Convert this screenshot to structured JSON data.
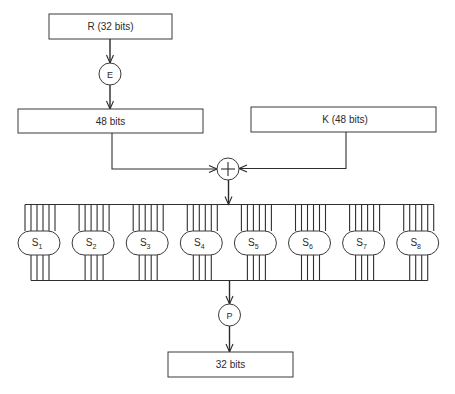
{
  "diagram": {
    "input_box": {
      "label": "R (32 bits)"
    },
    "expansion": {
      "label": "E"
    },
    "expanded_box": {
      "label": "48 bits"
    },
    "key_box": {
      "label": "K (48 bits)"
    },
    "xor": {
      "icon": "xor-circle-plus-icon"
    },
    "sboxes": [
      {
        "name": "S",
        "sub": "1"
      },
      {
        "name": "S",
        "sub": "2"
      },
      {
        "name": "S",
        "sub": "3"
      },
      {
        "name": "S",
        "sub": "4"
      },
      {
        "name": "S",
        "sub": "5"
      },
      {
        "name": "S",
        "sub": "6"
      },
      {
        "name": "S",
        "sub": "7"
      },
      {
        "name": "S",
        "sub": "8"
      }
    ],
    "sbox_inputs_per_box": 6,
    "sbox_outputs_per_box": 4,
    "permutation": {
      "label": "P"
    },
    "output_box": {
      "label": "32 bits"
    }
  },
  "colors": {
    "line": "#2f2f2f",
    "background": "#ffffff"
  }
}
